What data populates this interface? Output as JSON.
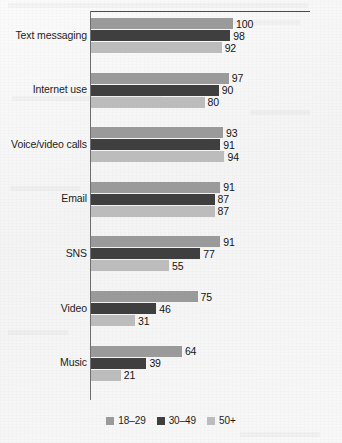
{
  "chart_data": {
    "type": "bar",
    "orientation": "horizontal",
    "title": "",
    "subtitle": "",
    "xlabel": "",
    "ylabel": "",
    "xlim": [
      0,
      100
    ],
    "grid": false,
    "legend_position": "bottom",
    "categories": [
      "Text messaging",
      "Internet use",
      "Voice/video calls",
      "Email",
      "SNS",
      "Video",
      "Music"
    ],
    "series": [
      {
        "name": "18–29",
        "color": "#9a9a9a",
        "values": [
          100,
          97,
          93,
          91,
          91,
          75,
          64
        ]
      },
      {
        "name": "30–49",
        "color": "#3f3f3f",
        "values": [
          98,
          90,
          91,
          87,
          77,
          46,
          39
        ]
      },
      {
        "name": "50+",
        "color": "#bcbcbc",
        "values": [
          92,
          80,
          94,
          87,
          55,
          31,
          21
        ]
      }
    ],
    "value_labels": [
      [
        "100",
        "98",
        "92"
      ],
      [
        "97",
        "90",
        "80"
      ],
      [
        "93",
        "91",
        "94"
      ],
      [
        "91",
        "87",
        "87"
      ],
      [
        "91",
        "77",
        "55"
      ],
      [
        "75",
        "46",
        "31"
      ],
      [
        "64",
        "39",
        "21"
      ]
    ],
    "legend": [
      {
        "label": "18–29",
        "color": "#9a9a9a"
      },
      {
        "label": "30–49",
        "color": "#3f3f3f"
      },
      {
        "label": "50+",
        "color": "#bcbcbc"
      }
    ],
    "axis": {
      "line_color": "#6e6e6e",
      "top_rule_color": "#4a4a4a"
    }
  }
}
